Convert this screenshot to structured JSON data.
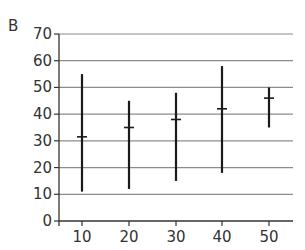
{
  "panel_label": "B",
  "chart_data": {
    "type": "range",
    "title": "",
    "xlabel": "",
    "ylabel": "",
    "categories": [
      "10",
      "20",
      "30",
      "40",
      "50"
    ],
    "series": [
      {
        "name": "max",
        "values": [
          55,
          45,
          48,
          58,
          50
        ]
      },
      {
        "name": "mean",
        "values": [
          31.5,
          35,
          38,
          42,
          46
        ]
      },
      {
        "name": "min",
        "values": [
          11,
          12,
          15,
          18,
          35
        ]
      }
    ],
    "yticks": [
      "0",
      "10",
      "20",
      "30",
      "40",
      "50",
      "60",
      "70"
    ],
    "ylim": [
      0,
      70
    ],
    "grid": true,
    "legend": "none"
  }
}
